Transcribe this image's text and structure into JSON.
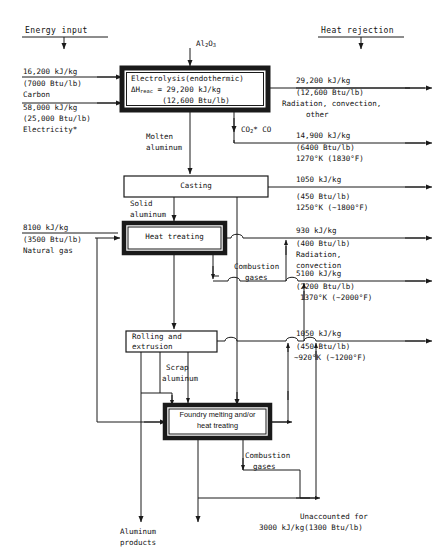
{
  "figure": {
    "headers": {
      "energy_input": "Energy input",
      "heat_rejection": "Heat rejection"
    }
  },
  "feed": {
    "alumina": "Al2O3",
    "alumina_formula": "Al₂O₃"
  },
  "inputs": [
    {
      "name": "carbon",
      "value": "16,200 kJ/kg",
      "imperial": "(7000 Btu/lb)",
      "material": "Carbon"
    },
    {
      "name": "electricity",
      "value": "58,000 kJ/kg",
      "imperial": "(25,000 Btu/lb)",
      "material": "Electricity*"
    },
    {
      "name": "natural-gas",
      "value": "8100 kJ/kg",
      "imperial": "(3500 Btu/lb)",
      "material": "Natural gas"
    }
  ],
  "processes": [
    {
      "id": "electrolysis",
      "line1": "Electrolysis(endothermic)",
      "line2": "ΔHreac = 29,200 kJ/kg",
      "line3": "(12,600 Btu/lb)",
      "bold_border": true
    },
    {
      "id": "casting",
      "label": "Casting",
      "bold_border": false
    },
    {
      "id": "heat-treating",
      "label": "Heat treating",
      "bold_border": true
    },
    {
      "id": "rolling-extrusion",
      "line1": "Rolling and",
      "line2": "extrusion",
      "bold_border": false
    },
    {
      "id": "foundry",
      "line1": "Foundry melting and/or",
      "line2": "heat treating",
      "bold_border": true
    }
  ],
  "streams": [
    {
      "id": "molten-aluminum",
      "line1": "Molten",
      "line2": "aluminum"
    },
    {
      "id": "solid-aluminum",
      "line1": "Solid",
      "line2": "aluminum"
    },
    {
      "id": "co2-co",
      "label": "CO₂* CO"
    },
    {
      "id": "combustion-gases-1",
      "line1": "Combustion",
      "line2": "gases"
    },
    {
      "id": "combustion-gases-2",
      "line1": "Combustion",
      "line2": "gases"
    },
    {
      "id": "scrap-aluminum",
      "line1": "Scrap",
      "line2": "aluminum"
    },
    {
      "id": "aluminum-products",
      "line1": "Aluminum",
      "line2": "products"
    }
  ],
  "rejections": [
    {
      "id": "radiation-convection-other",
      "value": "29,200 kJ/kg",
      "imperial": "(12,600 Btu/lb)",
      "note1": "Radiation, convection,",
      "note2": "other"
    },
    {
      "id": "co2-co-exhaust",
      "value": "14,900 kJ/kg",
      "imperial": "(6400 Btu/lb)",
      "temperature": "1270°K (1830°F)"
    },
    {
      "id": "casting-reject",
      "value": "1050 kJ/kg",
      "imperial": "(450 Btu/lb)",
      "temperature": "1250°K (~1800°F)"
    },
    {
      "id": "heat-treating-radiation",
      "value": "930 kJ/kg",
      "imperial": "(400 Btu/lb)",
      "note1": "Radiation,",
      "note2": "convection"
    },
    {
      "id": "combustion-gas-reject-1",
      "value": "5100 kJ/kg",
      "imperial": "(2200 Btu/lb)",
      "temperature": "1370°K (~2000°F)"
    },
    {
      "id": "combustion-gas-reject-2",
      "value": "1050 kJ/kg",
      "imperial": "(450 Btu/lb)",
      "temperature": "~920°K (~1200°F)"
    }
  ],
  "unaccounted": {
    "line1": "Unaccounted for",
    "line2": "3000 kJ/kg(1300 Btu/lb)"
  },
  "colors": {
    "line": "#1a1a1a",
    "bg": "#ffffff",
    "text": "#111111"
  }
}
